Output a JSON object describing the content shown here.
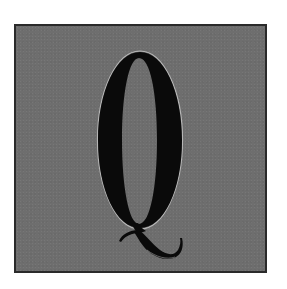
{
  "tile": {
    "letter": "Q",
    "background_color": "#6e6e6e",
    "border_color": "#2a2a2a",
    "glyph_color": "#0a0a0a",
    "highlight_color": "#d8d8d8"
  }
}
